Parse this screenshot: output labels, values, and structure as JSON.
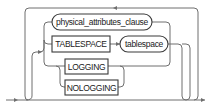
{
  "diagram": {
    "type": "railroad-syntax",
    "nodes": {
      "physical_attributes_clause": {
        "label": "physical_attributes_clause",
        "kind": "nonterminal"
      },
      "tablespace_kw": {
        "label": "TABLESPACE",
        "kind": "keyword"
      },
      "tablespace_name": {
        "label": "tablespace",
        "kind": "nonterminal"
      },
      "logging": {
        "label": "LOGGING",
        "kind": "keyword"
      },
      "nologging": {
        "label": "NOLOGGING",
        "kind": "keyword"
      }
    },
    "structure": "loop of choice: physical_attributes_clause | TABLESPACE tablespace | (LOGGING | NOLOGGING)"
  }
}
